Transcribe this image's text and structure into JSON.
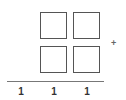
{
  "puzzle": {
    "operator": "+",
    "addend_rows": 2,
    "boxes_per_row": 2,
    "boxes": [
      {
        "row": 0,
        "col": 0,
        "value": ""
      },
      {
        "row": 0,
        "col": 1,
        "value": ""
      },
      {
        "row": 1,
        "col": 0,
        "value": ""
      },
      {
        "row": 1,
        "col": 1,
        "value": ""
      }
    ],
    "result_digits": [
      "1",
      "1",
      "1"
    ]
  },
  "colors": {
    "box_border": "#555555",
    "rule": "#777777",
    "digits": "#333333"
  }
}
